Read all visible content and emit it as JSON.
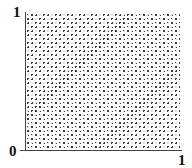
{
  "diagram": {
    "region": {
      "x_range": [
        0,
        1
      ],
      "y_range": [
        0,
        1
      ],
      "fill": "diagonal dotted hatch"
    },
    "labels": {
      "y_top": "1",
      "origin": "0",
      "x_right": "1"
    },
    "colors": {
      "hatch": "#333333",
      "axis": "#444444",
      "background": "#ffffff"
    }
  }
}
